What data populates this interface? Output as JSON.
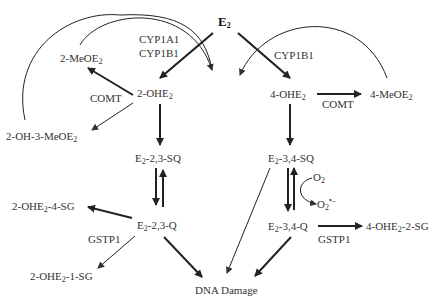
{
  "diagram": {
    "nodes": {
      "e2": {
        "base": "E",
        "sub": "2"
      },
      "cyp_left_1": "CYP1A1",
      "cyp_left_2": "CYP1B1",
      "cyp_right": "CYP1B1",
      "two_meoe2": {
        "base": "2-MeOE",
        "sub": "2"
      },
      "comt_left": "COMT",
      "two_ohe2": {
        "base": "2-OHE",
        "sub": "2"
      },
      "two_oh3meoe2": {
        "base": "2-OH-3-MeOE",
        "sub": "2"
      },
      "four_ohe2": {
        "base": "4-OHE",
        "sub": "2"
      },
      "comt_right": "COMT",
      "four_meoe2": {
        "base": "4-MeOE",
        "sub": "2"
      },
      "e2_23_sq": {
        "pre": "E",
        "sub": "2",
        "post": "-2,3-SQ"
      },
      "e2_34_sq": {
        "pre": "E",
        "sub": "2",
        "post": "-3,4-SQ"
      },
      "o2": {
        "base": "O",
        "sub": "2"
      },
      "o2_radical": {
        "base": "O",
        "sub": "2",
        "sup": "•–"
      },
      "two_ohe2_4sg": {
        "pre": "2-OHE",
        "sub": "2",
        "post": "-4-SG"
      },
      "e2_23_q": {
        "pre": "E",
        "sub": "2",
        "post": "-2,3-Q"
      },
      "e2_34_q": {
        "pre": "E",
        "sub": "2",
        "post": "-3,4-Q"
      },
      "four_ohe2_2sg": {
        "pre": "4-OHE",
        "sub": "2",
        "post": "-2-SG"
      },
      "gstp1_left": "GSTP1",
      "gstp1_right": "GSTP1",
      "two_ohe2_1sg": {
        "pre": "2-OHE",
        "sub": "2",
        "post": "-1-SG"
      },
      "dna_damage": "DNA Damage"
    },
    "colors": {
      "arrow": "#222222",
      "text": "#333333"
    }
  }
}
